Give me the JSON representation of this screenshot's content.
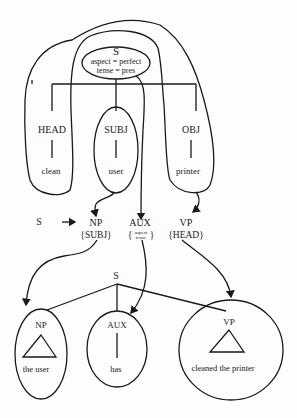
{
  "top_tree": {
    "root": {
      "label": "S",
      "features": [
        "aspect = perfect",
        "tense = pres"
      ]
    },
    "children": [
      {
        "role": "HEAD",
        "word": "clean"
      },
      {
        "role": "SUBJ",
        "word": "user"
      },
      {
        "role": "OBJ",
        "word": "printer"
      }
    ]
  },
  "rule": {
    "lhs": "S",
    "arrow": "→",
    "rhs": [
      {
        "cat": "NP",
        "annotation": "{SUBJ}"
      },
      {
        "cat": "AUX",
        "annotation_open": "{",
        "annotation_lines": [
          "aspect",
          "tense"
        ],
        "annotation_close": "}"
      },
      {
        "cat": "VP",
        "annotation": "{HEAD}"
      }
    ]
  },
  "bottom_tree": {
    "root": {
      "label": "S"
    },
    "children": [
      {
        "cat": "NP",
        "yield": "the user"
      },
      {
        "cat": "AUX",
        "yield": "has"
      },
      {
        "cat": "VP",
        "yield": "cleaned the printer"
      }
    ]
  }
}
